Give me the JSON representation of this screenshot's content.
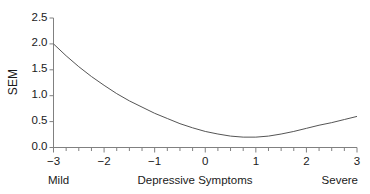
{
  "chart_data": {
    "type": "line",
    "title": "",
    "subtitle": "",
    "xlabel": "Depressive Symptoms",
    "ylabel": "SEM",
    "xlim": [
      -3,
      3
    ],
    "ylim": [
      0.0,
      2.5
    ],
    "grid": false,
    "legend": null,
    "x_anchor_low": "Mild",
    "x_anchor_high": "Severe",
    "x_ticks": [
      -3,
      -2,
      -1,
      0,
      1,
      2,
      3
    ],
    "x_tick_labels": [
      "−3",
      "−2",
      "−1",
      "0",
      "1",
      "2",
      "3"
    ],
    "x_minor_tick_step": 0.25,
    "y_ticks": [
      0.0,
      0.5,
      1.0,
      1.5,
      2.0,
      2.5
    ],
    "y_tick_labels": [
      "0.0",
      "0.5",
      "1.0",
      "1.5",
      "2.0",
      "2.5"
    ],
    "series": [
      {
        "name": "SEM",
        "color": "#555555",
        "x": [
          -3.0,
          -2.75,
          -2.5,
          -2.25,
          -2.0,
          -1.75,
          -1.5,
          -1.25,
          -1.0,
          -0.75,
          -0.5,
          -0.25,
          0.0,
          0.25,
          0.5,
          0.75,
          1.0,
          1.25,
          1.5,
          1.75,
          2.0,
          2.25,
          2.5,
          2.75,
          3.0
        ],
        "values": [
          2.0,
          1.77,
          1.56,
          1.37,
          1.2,
          1.04,
          0.9,
          0.78,
          0.66,
          0.56,
          0.46,
          0.38,
          0.31,
          0.26,
          0.22,
          0.2,
          0.2,
          0.22,
          0.26,
          0.31,
          0.37,
          0.43,
          0.48,
          0.54,
          0.6
        ]
      }
    ],
    "annotations": []
  },
  "axes": {
    "line_color": "#808080",
    "tick_color": "#808080"
  }
}
